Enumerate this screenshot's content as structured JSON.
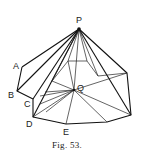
{
  "figure": {
    "caption": "Fig. 53.",
    "labels": {
      "P": "P",
      "Q": "Q",
      "A": "A",
      "B": "B",
      "C": "C",
      "D": "D",
      "E": "E"
    },
    "colors": {
      "line": "#111111",
      "background": "#ffffff"
    }
  }
}
